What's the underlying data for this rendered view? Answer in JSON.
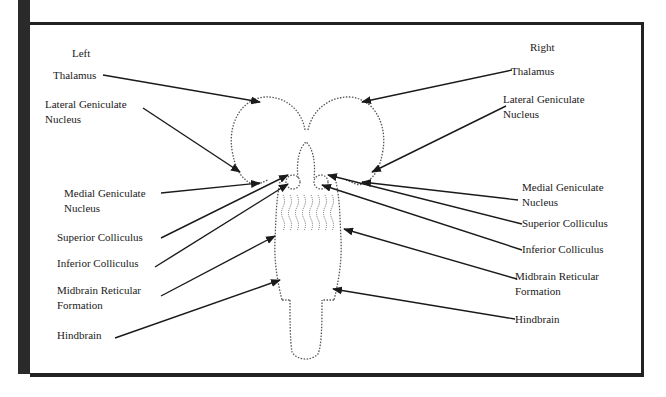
{
  "diagram": {
    "type": "labeled-anatomy",
    "side_headers": {
      "left": "Left",
      "right": "Right"
    },
    "left_labels": [
      {
        "id": "thalamus",
        "text": "Thalamus"
      },
      {
        "id": "lgn",
        "text": "Lateral Geniculate\nNucleus"
      },
      {
        "id": "mgn",
        "text": "Medial Geniculate\nNucleus"
      },
      {
        "id": "sup-coll",
        "text": "Superior Colliculus"
      },
      {
        "id": "inf-coll",
        "text": "Inferior Colliculus"
      },
      {
        "id": "mrf",
        "text": "Midbrain Reticular\nFormation"
      },
      {
        "id": "hindbrain",
        "text": "Hindbrain"
      }
    ],
    "right_labels": [
      {
        "id": "thalamus",
        "text": "Thalamus"
      },
      {
        "id": "lgn",
        "text": "Lateral Geniculate\nNucleus"
      },
      {
        "id": "mgn",
        "text": "Medial Geniculate\nNucleus"
      },
      {
        "id": "sup-coll",
        "text": "Superior Colliculus"
      },
      {
        "id": "inf-coll",
        "text": "Inferior Colliculus"
      },
      {
        "id": "mrf",
        "text": "Midbrain Reticular\nFormation"
      },
      {
        "id": "hindbrain",
        "text": "Hindbrain"
      }
    ],
    "colors": {
      "frame": "#222222",
      "outline": "#555555",
      "arrow": "#1a1a1a",
      "background": "#ffffff"
    }
  }
}
